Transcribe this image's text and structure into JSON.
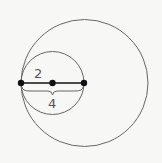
{
  "diagram": {
    "background": "#f7f7f5",
    "stroke_color": "#666666",
    "point_color": "#111111",
    "large_circle": {
      "cx": 84.5,
      "cy": 83,
      "r": 63.5
    },
    "small_circle": {
      "cx": 52.5,
      "cy": 83,
      "r": 31.5
    },
    "points": [
      {
        "x": 21,
        "y": 83
      },
      {
        "x": 52.5,
        "y": 83
      },
      {
        "x": 84,
        "y": 83
      }
    ],
    "labels": {
      "radius": "2",
      "diameter": "4"
    }
  }
}
